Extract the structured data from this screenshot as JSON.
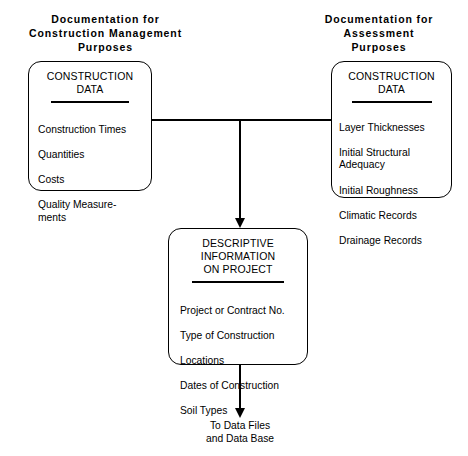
{
  "diagram": {
    "background_color": "#ffffff",
    "line_color": "#000000",
    "headings": {
      "left": "Documentation for\nConstruction Management\nPurposes",
      "right": "Documentation for\nAssessment\nPurposes"
    },
    "nodes": [
      {
        "id": "construction-management-data",
        "heading": "CONSTRUCTION\nDATA",
        "items": [
          "Construction Times",
          "Quantities",
          "Costs",
          "Quality Measure-\n   ments"
        ]
      },
      {
        "id": "assessment-data",
        "heading": "CONSTRUCTION\nDATA",
        "items": [
          "Layer Thicknesses",
          "Initial Structural\n    Adequacy",
          "Initial Roughness",
          "Climatic Records",
          "Drainage Records"
        ]
      },
      {
        "id": "descriptive-information",
        "heading": "DESCRIPTIVE\nINFORMATION\nON PROJECT",
        "items": [
          "Project or Contract No.",
          "Type of  Construction",
          "Locations",
          "Dates of Construction",
          "Soil Types"
        ]
      }
    ],
    "caption": {
      "data_files": "To Data Files\nand Data Base"
    }
  }
}
